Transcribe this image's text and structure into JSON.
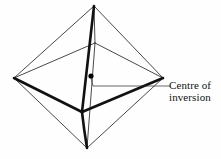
{
  "figure": {
    "shape_name": "octahedron",
    "background_color": "#fefefe",
    "line_color": "#1a1a1a",
    "thin_stroke_width": 0.8,
    "thick_stroke_width": 2.6,
    "leader_stroke_width": 0.7,
    "vertices": {
      "top": {
        "x": 94,
        "y": 6,
        "name": "top-vertex"
      },
      "bottom": {
        "x": 87,
        "y": 148,
        "name": "bottom-vertex"
      },
      "left": {
        "x": 14,
        "y": 78,
        "name": "left-vertex"
      },
      "right": {
        "x": 163,
        "y": 78,
        "name": "right-vertex"
      },
      "front": {
        "x": 82,
        "y": 112,
        "name": "front-vertex"
      },
      "back": {
        "x": 95,
        "y": 43,
        "name": "back-vertex"
      }
    },
    "centre_point": {
      "x": 91,
      "y": 76,
      "radius": 2.6,
      "color": "#000000"
    },
    "thin_edges": [
      {
        "from": "top",
        "to": "left",
        "name": "edge-top-left"
      },
      {
        "from": "top",
        "to": "right",
        "name": "edge-top-right"
      },
      {
        "from": "top",
        "to": "back",
        "name": "edge-top-back"
      },
      {
        "from": "bottom",
        "to": "left",
        "name": "edge-bottom-left"
      },
      {
        "from": "bottom",
        "to": "right",
        "name": "edge-bottom-right"
      },
      {
        "from": "bottom",
        "to": "back",
        "name": "edge-bottom-back"
      },
      {
        "from": "left",
        "to": "back",
        "name": "edge-left-back"
      },
      {
        "from": "right",
        "to": "back",
        "name": "edge-right-back"
      }
    ],
    "thick_edges": [
      {
        "from": "top",
        "to": "front",
        "name": "edge-top-front"
      },
      {
        "from": "bottom",
        "to": "front",
        "name": "edge-bottom-front"
      },
      {
        "from": "left",
        "to": "front",
        "name": "edge-left-front"
      },
      {
        "from": "right",
        "to": "front",
        "name": "edge-right-front"
      }
    ],
    "leader": {
      "name": "leader-line",
      "points": "91,78 93,86 170,86"
    }
  },
  "annotation": {
    "line1": "Centre of",
    "line2": "inversion"
  }
}
